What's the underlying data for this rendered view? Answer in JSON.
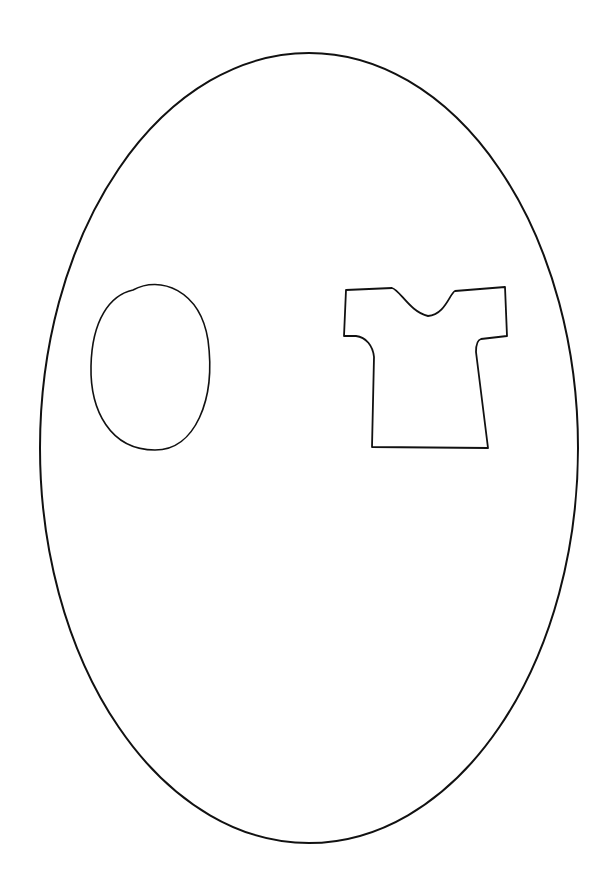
{
  "drawing": {
    "title": "Line drawing: oval and t-shirt inside a large egg shape",
    "stroke_color": "#111111",
    "background": "#ffffff",
    "shapes": [
      {
        "name": "large-egg",
        "type": "ellipse",
        "cx": 309,
        "cy": 448,
        "rx": 269,
        "ry": 395
      },
      {
        "name": "small-oval",
        "type": "ellipse",
        "cx": 151,
        "cy": 366,
        "rx": 60,
        "ry": 83
      },
      {
        "name": "t-shirt",
        "type": "outline"
      }
    ]
  }
}
